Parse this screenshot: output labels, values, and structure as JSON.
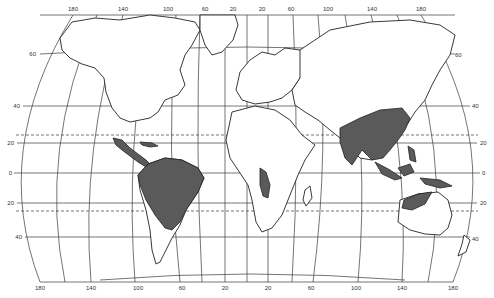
{
  "map": {
    "title": "",
    "projection": "World map (Eckert-like pseudocylindrical)",
    "colors": {
      "background": "#ffffff",
      "land": "#ffffff",
      "coastline": "#222222",
      "shaded_region": "#5a5a5a",
      "grid": "#3a3a3a"
    },
    "longitude_labels_top": [
      "180",
      "140",
      "100",
      "60",
      "20",
      "20",
      "60",
      "100",
      "140",
      "180"
    ],
    "longitude_labels_bottom": [
      "180",
      "140",
      "100",
      "60",
      "20",
      "20",
      "60",
      "100",
      "140",
      "180"
    ],
    "latitude_labels_left": [
      "60",
      "40",
      "20",
      "0",
      "20",
      "40"
    ],
    "latitude_labels_right": [
      "60",
      "40",
      "20",
      "0",
      "20",
      "40"
    ],
    "dashed_lines": [
      "Tropic of Cancer",
      "Tropic of Capricorn"
    ],
    "shaded_regions": [
      "Central America & southern Mexico",
      "Northern South America (Amazon basin to Brazil)",
      "West-central Africa coast (Angola)",
      "South & Southeast Asia (India to southern China)",
      "Indonesia / Malay Archipelago / New Guinea",
      "Northern Australia"
    ]
  }
}
